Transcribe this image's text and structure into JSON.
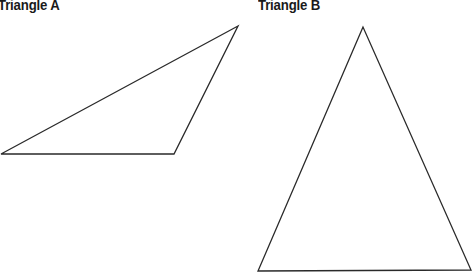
{
  "figures": [
    {
      "label": "Triangle A",
      "vertices": [
        [
          238,
          26
        ],
        [
          1,
          154
        ],
        [
          174,
          154
        ]
      ],
      "stroke": "#2a2a2a"
    },
    {
      "label": "Triangle B",
      "vertices": [
        [
          363,
          27
        ],
        [
          258,
          271
        ],
        [
          471,
          270
        ]
      ],
      "stroke": "#2a2a2a"
    }
  ]
}
